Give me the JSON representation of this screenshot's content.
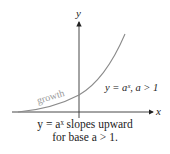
{
  "diagram": {
    "axes": {
      "y_label": "y",
      "x_label": "x"
    },
    "curve": {
      "label": "growth",
      "equation": "y = aˣ, a > 1",
      "color": "#8a8a8a"
    },
    "caption": {
      "line1": "y = aˣ slopes upward",
      "line2": "for base a > 1."
    }
  }
}
